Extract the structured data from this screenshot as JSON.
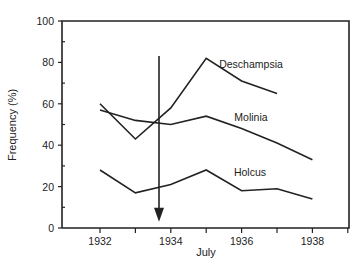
{
  "chart_data": {
    "type": "line",
    "title": "",
    "xlabel": "July",
    "ylabel": "Frequency (%)",
    "x": [
      1932,
      1933,
      1934,
      1935,
      1936,
      1937,
      1938
    ],
    "xticks": [
      1932,
      1933,
      1934,
      1935,
      1936,
      1937,
      1938,
      1939
    ],
    "xtick_labels": [
      "1932",
      "1934",
      "1936",
      "1938"
    ],
    "yticks": [
      0,
      20,
      40,
      60,
      80,
      100
    ],
    "ylim": [
      0,
      100
    ],
    "xlim": [
      1931,
      1939
    ],
    "grid": false,
    "legend": "inline labels",
    "series": [
      {
        "name": "Deschampsia",
        "x": [
          1932,
          1933,
          1934,
          1935,
          1936,
          1937
        ],
        "values": [
          60,
          43,
          58,
          82,
          71,
          65
        ]
      },
      {
        "name": "Molinia",
        "x": [
          1932,
          1933,
          1934,
          1935,
          1936,
          1937,
          1938
        ],
        "values": [
          57,
          52,
          50,
          54,
          48,
          41,
          33
        ]
      },
      {
        "name": "Holcus",
        "x": [
          1932,
          1933,
          1934,
          1935,
          1936,
          1937,
          1938
        ],
        "values": [
          28,
          17,
          21,
          28,
          18,
          19,
          14
        ]
      }
    ],
    "annotations": [
      {
        "type": "arrow",
        "x": 1933.7,
        "from_y": 84,
        "to_y": 4,
        "direction": "down"
      }
    ]
  }
}
